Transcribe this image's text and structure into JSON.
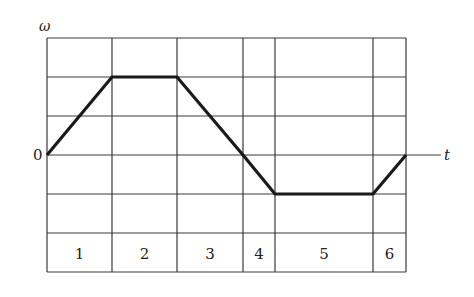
{
  "chart_data": {
    "type": "line",
    "title": "",
    "xlabel": "t",
    "ylabel": "ω",
    "origin_label": "0",
    "grid": true,
    "x": [
      0,
      2,
      4,
      6,
      7,
      10,
      11
    ],
    "series": [
      {
        "name": "ω(t)",
        "values": [
          0,
          2,
          2,
          0,
          -1,
          -1,
          0
        ]
      }
    ],
    "ylim": [
      -2,
      3
    ],
    "intervals": [
      {
        "label": "1",
        "start": 0,
        "end": 2
      },
      {
        "label": "2",
        "start": 2,
        "end": 4
      },
      {
        "label": "3",
        "start": 4,
        "end": 6
      },
      {
        "label": "4",
        "start": 6,
        "end": 7
      },
      {
        "label": "5",
        "start": 7,
        "end": 10
      },
      {
        "label": "6",
        "start": 10,
        "end": 11
      }
    ],
    "colors": {
      "grid": "#333333",
      "curve": "#1a1a1a"
    }
  },
  "labels": {
    "y_axis": "ω",
    "x_axis": "t",
    "zero": "0",
    "intervals": [
      "1",
      "2",
      "3",
      "4",
      "5",
      "6"
    ]
  }
}
